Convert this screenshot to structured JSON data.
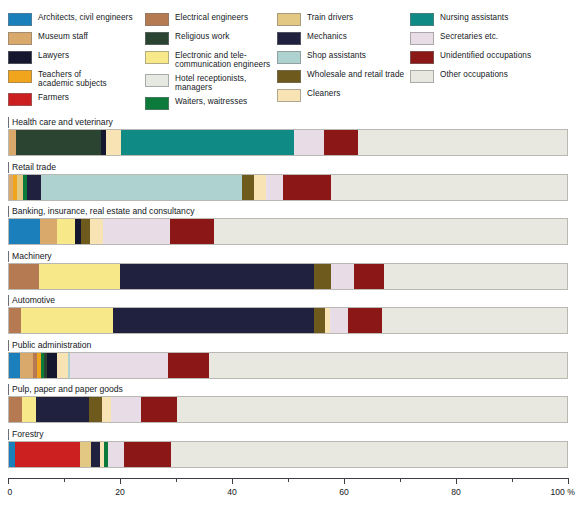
{
  "legend": {
    "columns": [
      [
        {
          "label": "Architects, civil engineers",
          "color": "#1b7fbc"
        },
        {
          "label": "Museum staff",
          "color": "#d9a96c"
        },
        {
          "label": "Lawyers",
          "color": "#14172e"
        },
        {
          "label": "Teachers of\nacademic subjects",
          "color": "#f0a51d"
        },
        {
          "label": "Farmers",
          "color": "#cc1f1f"
        }
      ],
      [
        {
          "label": "Electrical engineers",
          "color": "#b57a52"
        },
        {
          "label": "Religious work",
          "color": "#2b4432"
        },
        {
          "label": "Electronic and tele-\ncommunication engineers",
          "color": "#f7e98a"
        },
        {
          "label": "Hotel receptionists, managers",
          "color": "#e6e9e2"
        },
        {
          "label": "Waiters, waitresses",
          "color": "#0b7a3b"
        }
      ],
      [
        {
          "label": "Train drivers",
          "color": "#e3c883"
        },
        {
          "label": "Mechanics",
          "color": "#20203f"
        },
        {
          "label": "Shop assistants",
          "color": "#aed2d0"
        },
        {
          "label": "Wholesale and retail trade",
          "color": "#6d5a1c"
        },
        {
          "label": "Cleaners",
          "color": "#f7e3b4"
        }
      ],
      [
        {
          "label": "Nursing assistants",
          "color": "#0f8a85"
        },
        {
          "label": "Secretaries etc.",
          "color": "#e8dde6"
        },
        {
          "label": "Unidentified occupations",
          "color": "#8c1717"
        },
        {
          "label": "Other occupations",
          "color": "#e9e8e0"
        }
      ]
    ]
  },
  "axis": {
    "labels": [
      "0",
      "20",
      "40",
      "60",
      "80",
      "100 %"
    ],
    "values": [
      0,
      20,
      40,
      60,
      80,
      100
    ],
    "minor_values": [
      10,
      30,
      50,
      70,
      90
    ],
    "min": 0,
    "max": 100,
    "unit": "%"
  },
  "chart_data": {
    "type": "bar",
    "orientation": "horizontal",
    "stacked": true,
    "title": "",
    "xlabel": "",
    "ylabel": "",
    "xlim": [
      0,
      100
    ],
    "grid": false,
    "legend_position": "top",
    "categories": [
      "Health care and veterinary",
      "Retail trade",
      "Banking, insurance, real estate and consultancy",
      "Machinery",
      "Automotive",
      "Public administration",
      "Pulp, paper and paper goods",
      "Forestry"
    ],
    "series": [
      {
        "name": "Architects, civil engineers",
        "color": "#1b7fbc"
      },
      {
        "name": "Museum staff",
        "color": "#d9a96c"
      },
      {
        "name": "Lawyers",
        "color": "#14172e"
      },
      {
        "name": "Teachers of academic subjects",
        "color": "#f0a51d"
      },
      {
        "name": "Farmers",
        "color": "#cc1f1f"
      },
      {
        "name": "Electrical engineers",
        "color": "#b57a52"
      },
      {
        "name": "Religious work",
        "color": "#2b4432"
      },
      {
        "name": "Electronic and telecommunication engineers",
        "color": "#f7e98a"
      },
      {
        "name": "Hotel receptionists, managers",
        "color": "#e6e9e2"
      },
      {
        "name": "Waiters, waitresses",
        "color": "#0b7a3b"
      },
      {
        "name": "Train drivers",
        "color": "#e3c883"
      },
      {
        "name": "Mechanics",
        "color": "#20203f"
      },
      {
        "name": "Shop assistants",
        "color": "#aed2d0"
      },
      {
        "name": "Wholesale and retail trade",
        "color": "#6d5a1c"
      },
      {
        "name": "Cleaners",
        "color": "#f7e3b4"
      },
      {
        "name": "Nursing assistants",
        "color": "#0f8a85"
      },
      {
        "name": "Secretaries etc.",
        "color": "#e8dde6"
      },
      {
        "name": "Unidentified occupations",
        "color": "#8c1717"
      },
      {
        "name": "Other occupations",
        "color": "#e9e8e0"
      }
    ],
    "bars": [
      {
        "category": "Health care and veterinary",
        "segments": [
          {
            "name": "Museum staff",
            "color": "#d9a96c",
            "value": 1.2
          },
          {
            "name": "Religious work",
            "color": "#2b4432",
            "value": 15.3
          },
          {
            "name": "Lawyers",
            "color": "#14172e",
            "value": 0.8
          },
          {
            "name": "Cleaners",
            "color": "#f7e3b4",
            "value": 2.8
          },
          {
            "name": "Nursing assistants",
            "color": "#0f8a85",
            "value": 31.0
          },
          {
            "name": "Secretaries etc.",
            "color": "#e8dde6",
            "value": 5.4
          },
          {
            "name": "Unidentified occupations",
            "color": "#8c1717",
            "value": 6.1
          },
          {
            "name": "Other occupations",
            "color": "#e9e8e0",
            "value": 37.4
          }
        ]
      },
      {
        "category": "Retail trade",
        "segments": [
          {
            "name": "Museum staff",
            "color": "#d9a96c",
            "value": 0.8
          },
          {
            "name": "Teachers of academic subjects",
            "color": "#f0a51d",
            "value": 0.7
          },
          {
            "name": "Train drivers",
            "color": "#e3c883",
            "value": 1.0
          },
          {
            "name": "Waiters, waitresses",
            "color": "#0b7a3b",
            "value": 0.8
          },
          {
            "name": "Mechanics",
            "color": "#20203f",
            "value": 2.5
          },
          {
            "name": "Shop assistants",
            "color": "#aed2d0",
            "value": 36.0
          },
          {
            "name": "Wholesale and retail trade",
            "color": "#6d5a1c",
            "value": 2.2
          },
          {
            "name": "Cleaners",
            "color": "#f7e3b4",
            "value": 2.0
          },
          {
            "name": "Secretaries etc.",
            "color": "#e8dde6",
            "value": 3.2
          },
          {
            "name": "Unidentified occupations",
            "color": "#8c1717",
            "value": 8.6
          },
          {
            "name": "Other occupations",
            "color": "#e9e8e0",
            "value": 42.2
          }
        ]
      },
      {
        "category": "Banking, insurance, real estate and consultancy",
        "segments": [
          {
            "name": "Architects, civil engineers",
            "color": "#1b7fbc",
            "value": 5.6
          },
          {
            "name": "Museum staff",
            "color": "#d9a96c",
            "value": 3.0
          },
          {
            "name": "Electronic and telecommunication engineers",
            "color": "#f7e98a",
            "value": 3.2
          },
          {
            "name": "Lawyers",
            "color": "#14172e",
            "value": 1.1
          },
          {
            "name": "Wholesale and retail trade",
            "color": "#6d5a1c",
            "value": 1.6
          },
          {
            "name": "Cleaners",
            "color": "#f7e3b4",
            "value": 2.3
          },
          {
            "name": "Secretaries etc.",
            "color": "#e8dde6",
            "value": 12.0
          },
          {
            "name": "Unidentified occupations",
            "color": "#8c1717",
            "value": 8.0
          },
          {
            "name": "Other occupations",
            "color": "#e9e8e0",
            "value": 63.2
          }
        ]
      },
      {
        "category": "Machinery",
        "segments": [
          {
            "name": "Electrical engineers",
            "color": "#b57a52",
            "value": 5.3
          },
          {
            "name": "Electronic and telecommunication engineers",
            "color": "#f7e98a",
            "value": 14.6
          },
          {
            "name": "Mechanics",
            "color": "#20203f",
            "value": 34.8
          },
          {
            "name": "Wholesale and retail trade",
            "color": "#6d5a1c",
            "value": 3.1
          },
          {
            "name": "Secretaries etc.",
            "color": "#e8dde6",
            "value": 4.0
          },
          {
            "name": "Unidentified occupations",
            "color": "#8c1717",
            "value": 5.4
          },
          {
            "name": "Other occupations",
            "color": "#e9e8e0",
            "value": 32.8
          }
        ]
      },
      {
        "category": "Automotive",
        "segments": [
          {
            "name": "Electrical engineers",
            "color": "#b57a52",
            "value": 2.2
          },
          {
            "name": "Electronic and telecommunication engineers",
            "color": "#f7e98a",
            "value": 16.5
          },
          {
            "name": "Mechanics",
            "color": "#20203f",
            "value": 36.0
          },
          {
            "name": "Wholesale and retail trade",
            "color": "#6d5a1c",
            "value": 2.0
          },
          {
            "name": "Cleaners",
            "color": "#f7e3b4",
            "value": 0.9
          },
          {
            "name": "Secretaries etc.",
            "color": "#e8dde6",
            "value": 3.2
          },
          {
            "name": "Unidentified occupations",
            "color": "#8c1717",
            "value": 6.0
          },
          {
            "name": "Other occupations",
            "color": "#e9e8e0",
            "value": 33.2
          }
        ]
      },
      {
        "category": "Public administration",
        "segments": [
          {
            "name": "Architects, civil engineers",
            "color": "#1b7fbc",
            "value": 1.9
          },
          {
            "name": "Museum staff",
            "color": "#d9a96c",
            "value": 2.4
          },
          {
            "name": "Electrical engineers",
            "color": "#b57a52",
            "value": 0.7
          },
          {
            "name": "Teachers of academic subjects",
            "color": "#f0a51d",
            "value": 0.7
          },
          {
            "name": "Waiters, waitresses",
            "color": "#0b7a3b",
            "value": 0.6
          },
          {
            "name": "Religious work",
            "color": "#2b4432",
            "value": 0.6
          },
          {
            "name": "Lawyers",
            "color": "#14172e",
            "value": 1.7
          },
          {
            "name": "Cleaners",
            "color": "#f7e3b4",
            "value": 1.9
          },
          {
            "name": "Shop assistants",
            "color": "#aed2d0",
            "value": 0.5
          },
          {
            "name": "Secretaries etc.",
            "color": "#e8dde6",
            "value": 17.5
          },
          {
            "name": "Unidentified occupations",
            "color": "#8c1717",
            "value": 7.3
          },
          {
            "name": "Other occupations",
            "color": "#e9e8e0",
            "value": 64.2
          }
        ]
      },
      {
        "category": "Pulp, paper and paper goods",
        "segments": [
          {
            "name": "Electrical engineers",
            "color": "#b57a52",
            "value": 2.3
          },
          {
            "name": "Electronic and telecommunication engineers",
            "color": "#f7e98a",
            "value": 2.6
          },
          {
            "name": "Mechanics",
            "color": "#20203f",
            "value": 9.5
          },
          {
            "name": "Wholesale and retail trade",
            "color": "#6d5a1c",
            "value": 2.2
          },
          {
            "name": "Cleaners",
            "color": "#f7e3b4",
            "value": 1.7
          },
          {
            "name": "Secretaries etc.",
            "color": "#e8dde6",
            "value": 5.3
          },
          {
            "name": "Unidentified occupations",
            "color": "#8c1717",
            "value": 6.6
          },
          {
            "name": "Other occupations",
            "color": "#e9e8e0",
            "value": 69.8
          }
        ]
      },
      {
        "category": "Forestry",
        "segments": [
          {
            "name": "Architects, civil engineers",
            "color": "#1b7fbc",
            "value": 1.0
          },
          {
            "name": "Farmers",
            "color": "#cc1f1f",
            "value": 11.8
          },
          {
            "name": "Train drivers",
            "color": "#e3c883",
            "value": 1.9
          },
          {
            "name": "Mechanics",
            "color": "#20203f",
            "value": 1.6
          },
          {
            "name": "Cleaners",
            "color": "#f7e3b4",
            "value": 0.8
          },
          {
            "name": "Waiters, waitresses",
            "color": "#0b7a3b",
            "value": 0.6
          },
          {
            "name": "Secretaries etc.",
            "color": "#e8dde6",
            "value": 3.0
          },
          {
            "name": "Unidentified occupations",
            "color": "#8c1717",
            "value": 8.4
          },
          {
            "name": "Other occupations",
            "color": "#e9e8e0",
            "value": 70.9
          }
        ]
      }
    ]
  }
}
